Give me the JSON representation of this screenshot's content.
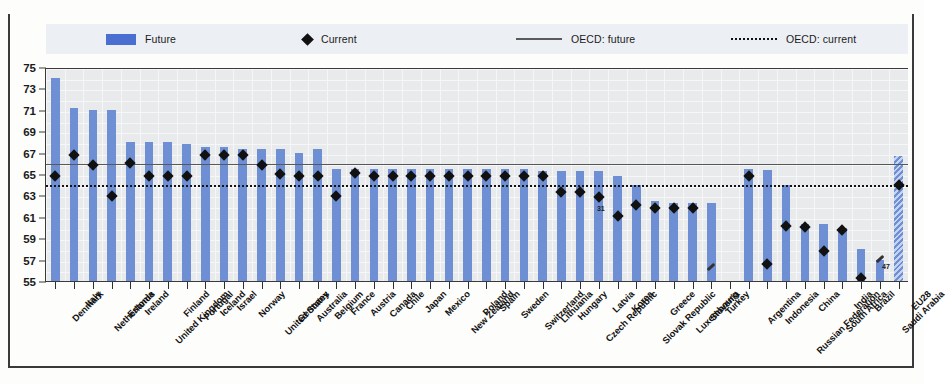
{
  "chart_data": {
    "type": "bar",
    "title": "",
    "subtitle": "",
    "xlabel": "",
    "ylabel": "",
    "ylim": [
      55,
      75
    ],
    "ytick_step": 2,
    "yticks": [
      75,
      73,
      71,
      69,
      67,
      65,
      63,
      61,
      59,
      57,
      55
    ],
    "grid": true,
    "legend_position": "top",
    "legend": [
      {
        "key": "future",
        "label": "Future",
        "marker": "bar",
        "color": "#4a6fd0"
      },
      {
        "key": "current",
        "label": "Current",
        "marker": "diamond",
        "color": "#111111"
      },
      {
        "key": "oecd_future",
        "label": "OECD: future",
        "marker": "solid-line",
        "color": "#585858"
      },
      {
        "key": "oecd_current",
        "label": "OECD: current",
        "marker": "dotted-line",
        "color": "#141414"
      }
    ],
    "reference_lines": [
      {
        "name": "OECD: future",
        "value": 66.1,
        "style": "solid"
      },
      {
        "name": "OECD: current",
        "value": 64.2,
        "style": "dotted"
      }
    ],
    "categories": [
      "Denmark",
      "Italy",
      "Netherlands",
      "Estonia",
      "Ireland",
      "United Kingdom",
      "Finland",
      "Portugal",
      "Iceland",
      "Israel",
      "Norway",
      "United States",
      "Germany",
      "Australia",
      "Belgium",
      "France",
      "Austria",
      "Canada",
      "Chile",
      "Japan",
      "Mexico",
      "New Zealand",
      "Poland",
      "Spain",
      "Sweden",
      "Switzerland",
      "Lithuania",
      "Hungary",
      "Czech Republic",
      "Latvia",
      "Korea",
      "Slovak Republic",
      "Greece",
      "Luxembourg",
      "Slovenia",
      "Turkey",
      "",
      "Argentina",
      "Indonesia",
      "Russian Federation",
      "China",
      "South Africa",
      "India",
      "Brazil",
      "Saudi Arabia",
      "EU28"
    ],
    "series": [
      {
        "name": "Future",
        "type": "bar",
        "color": "#6f8fd4",
        "values": [
          74.0,
          71.2,
          71.0,
          71.0,
          68.0,
          68.0,
          68.0,
          67.8,
          67.5,
          67.5,
          67.3,
          67.3,
          67.3,
          67.0,
          67.3,
          65.5,
          65.5,
          65.5,
          65.5,
          65.5,
          65.5,
          65.5,
          65.5,
          65.5,
          65.5,
          65.5,
          65.3,
          65.3,
          65.3,
          65.3,
          64.8,
          64.0,
          62.5,
          62.3,
          62.3,
          62.3,
          null,
          65.5,
          65.4,
          64.0,
          60.3,
          60.3,
          60.0,
          58.0,
          57.0,
          66.7
        ]
      },
      {
        "name": "Current",
        "type": "scatter",
        "marker": "diamond",
        "color": "#111111",
        "values": [
          65.0,
          67.0,
          66.0,
          63.1,
          66.2,
          65.0,
          65.0,
          65.0,
          67.0,
          67.0,
          67.0,
          66.0,
          65.2,
          65.0,
          65.0,
          63.1,
          65.3,
          65.0,
          65.0,
          65.0,
          65.0,
          65.0,
          65.0,
          65.0,
          65.0,
          65.0,
          65.0,
          63.5,
          63.5,
          63.0,
          61.3,
          62.3,
          62.0,
          62.0,
          62.0,
          null,
          null,
          65.0,
          56.8,
          60.3,
          60.2,
          58.0,
          60.0,
          55.5,
          null,
          64.2
        ]
      }
    ],
    "annotations": [
      {
        "category": "Latvia",
        "text": "31",
        "value": 62.0,
        "note": "value label"
      },
      {
        "category": "Turkey",
        "text": "",
        "value": 56.5,
        "note": "off-scale marker"
      },
      {
        "category": "Saudi Arabia",
        "text": "47",
        "value": 57.2,
        "note": "off-scale marker with value"
      }
    ]
  }
}
